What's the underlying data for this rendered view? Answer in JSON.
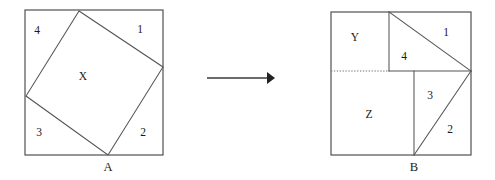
{
  "figure": {
    "background_color": "#ffffff",
    "stroke_color": "#4a4a4a",
    "text_color": "#1a1a1a"
  },
  "left_figure": {
    "name": "outer square with inscribed tilted square",
    "outer_square": {
      "x": 25,
      "y": 10,
      "width": 138,
      "height": 145
    },
    "inner_square_vertices": [
      {
        "x": 79,
        "y": 11
      },
      {
        "x": 163,
        "y": 67
      },
      {
        "x": 108,
        "y": 155
      },
      {
        "x": 26,
        "y": 96
      }
    ],
    "region_labels": [
      {
        "text": "4",
        "x": 37,
        "y": 31
      },
      {
        "text": "1",
        "x": 140,
        "y": 30
      },
      {
        "text": "X",
        "x": 83,
        "y": 77
      },
      {
        "text": "3",
        "x": 39,
        "y": 133
      },
      {
        "text": "2",
        "x": 143,
        "y": 133
      }
    ],
    "point_label": {
      "text": "A",
      "x": 108,
      "y": 168
    }
  },
  "arrow": {
    "name": "transformation arrow",
    "from_x": 207,
    "to_x": 268,
    "y": 78,
    "head_tip_x": 275,
    "head_half_height": 6
  },
  "right_figure": {
    "name": "rearranged square with regions Y and Z",
    "outer_square": {
      "x": 331,
      "y": 12,
      "width": 140,
      "height": 143
    },
    "divider_vertical_top": {
      "x": 389,
      "y1": 12,
      "y2": 71
    },
    "divider_horizontal": {
      "x1": 389,
      "x2": 471,
      "y": 71
    },
    "divider_dotted": {
      "x1": 331,
      "x2": 389,
      "y": 71
    },
    "divider_vertical_bottom": {
      "x": 414,
      "y1": 71,
      "y2": 155
    },
    "diagonal_upper": {
      "x1": 389,
      "y1": 12,
      "x2": 471,
      "y2": 71
    },
    "diagonal_lower": {
      "x1": 414,
      "y1": 155,
      "x2": 471,
      "y2": 71
    },
    "region_labels": [
      {
        "text": "Y",
        "x": 355,
        "y": 38
      },
      {
        "text": "4",
        "x": 404,
        "y": 57
      },
      {
        "text": "1",
        "x": 446,
        "y": 33
      },
      {
        "text": "Z",
        "x": 369,
        "y": 115
      },
      {
        "text": "3",
        "x": 430,
        "y": 96
      },
      {
        "text": "2",
        "x": 450,
        "y": 130
      }
    ],
    "point_label": {
      "text": "B",
      "x": 414,
      "y": 168
    }
  }
}
